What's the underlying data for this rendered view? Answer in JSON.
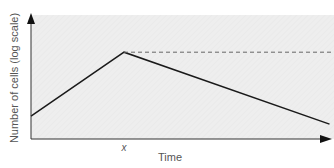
{
  "chart_data": {
    "type": "line",
    "title": "",
    "xlabel": "Time",
    "ylabel": "Number of cells (log scale)",
    "xlim": [
      0,
      10
    ],
    "ylim": [
      0,
      10
    ],
    "x_ticks": [
      {
        "value": 3.07,
        "label": "x"
      }
    ],
    "grid": false,
    "legend": "none",
    "series": [
      {
        "name": "cell count",
        "style": "solid",
        "color": "#1a1a1a",
        "x": [
          0,
          3.07,
          9.85
        ],
        "y": [
          1.85,
          7.0,
          1.2
        ]
      },
      {
        "name": "peak level",
        "style": "dashed",
        "color": "#666666",
        "x": [
          3.07,
          10
        ],
        "y": [
          7.0,
          7.0
        ]
      }
    ],
    "plot_background": "#eeeeee"
  }
}
